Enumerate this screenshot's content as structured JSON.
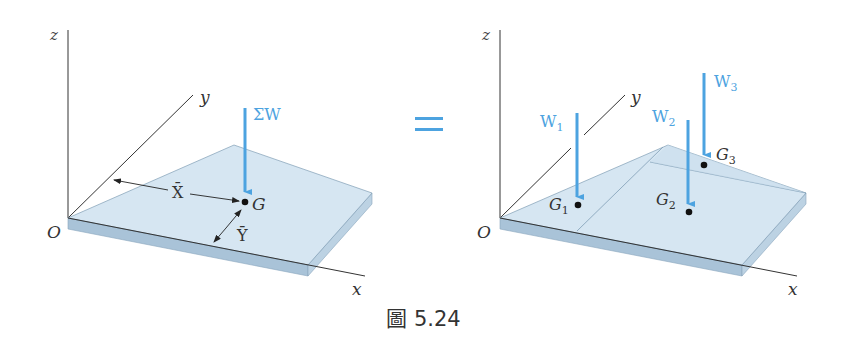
{
  "figure": {
    "caption": "圖 5.24",
    "equals_sign": "=",
    "colors": {
      "force_arrow": "#4da3e0",
      "plate_top": "#d6e6f2",
      "plate_side": "#a9c3d8",
      "axis": "#333333",
      "label": "#222222"
    }
  },
  "left_panel": {
    "axes": {
      "x": "x",
      "y": "y",
      "z": "z",
      "origin": "O"
    },
    "resultant_force": "ΣW",
    "centroid": "G",
    "dim_x": "X̄",
    "dim_y": "Ȳ"
  },
  "right_panel": {
    "axes": {
      "x": "x",
      "y": "y",
      "z": "z",
      "origin": "O"
    },
    "forces": [
      {
        "label": "W",
        "sub": "1",
        "point": "G",
        "point_sub": "1"
      },
      {
        "label": "W",
        "sub": "2",
        "point": "G",
        "point_sub": "2"
      },
      {
        "label": "W",
        "sub": "3",
        "point": "G",
        "point_sub": "3"
      }
    ]
  }
}
